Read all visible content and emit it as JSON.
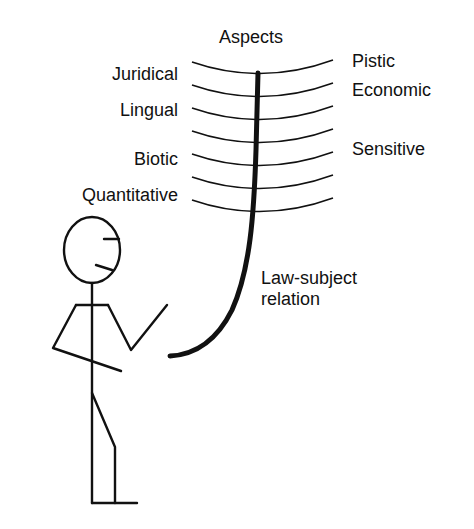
{
  "title": "Aspects",
  "left_labels": [
    "Juridical",
    "Lingual",
    "Biotic",
    "Quantitative"
  ],
  "right_labels": [
    "Pistic",
    "Economic",
    "Sensitive"
  ],
  "relation_label": {
    "line1": "Law-subject",
    "line2": "relation"
  },
  "colors": {
    "ink": "#111111",
    "background": "#ffffff"
  }
}
